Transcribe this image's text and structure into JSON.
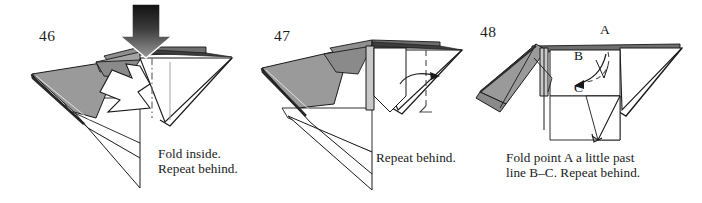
{
  "document": {
    "kind": "origami-instruction-strip",
    "background_color": "#ffffff",
    "ink_color": "#1a1a1a",
    "paper_shade_color": "#999999",
    "paper_shade_dark_color": "#6e6e6e",
    "paper_white_color": "#ffffff",
    "arrow_dark_color": "#262626"
  },
  "panels": [
    {
      "number": "46",
      "caption": "Fold inside.\nRepeat behind.",
      "arrow_kind": "push-arrow-down",
      "secondary_arrow_kind": "hollow-inside-fold-arrow",
      "fold_line_kind": "dash-dot"
    },
    {
      "number": "47",
      "caption": "Repeat behind.",
      "arrow_kind": "curved-valley-fold-arrow-right",
      "fold_line_kind": "dashed"
    },
    {
      "number": "48",
      "caption": "Fold point A a little past\nline B–C. Repeat behind.",
      "arrow_kind": "curved-fold-arrow-down-left",
      "fold_line_kind": "dashed",
      "point_labels": [
        {
          "text": "A"
        },
        {
          "text": "B"
        },
        {
          "text": "C"
        }
      ]
    }
  ]
}
